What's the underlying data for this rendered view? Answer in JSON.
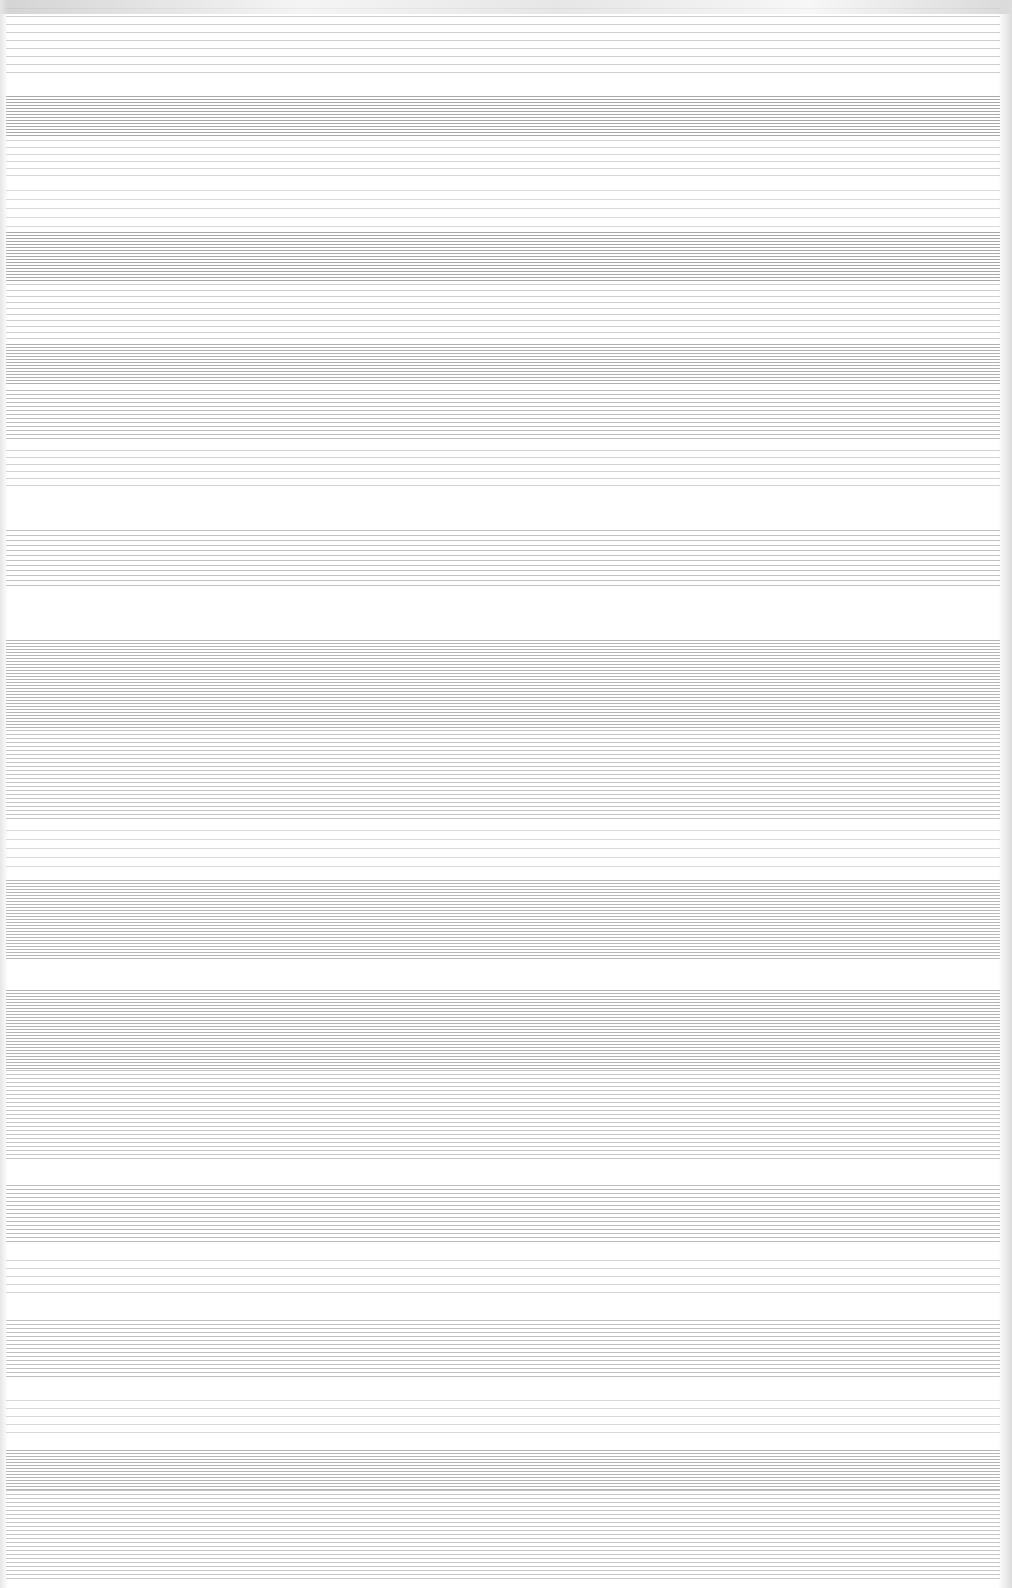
{
  "page": {
    "background": "#ffffff",
    "description_visible_text": []
  },
  "bands": [
    {
      "top": 8,
      "height": 70,
      "color": "#cfcfcf",
      "gap": 8
    },
    {
      "top": 96,
      "height": 40,
      "color": "#a9a9a9",
      "gap": 3
    },
    {
      "top": 140,
      "height": 40,
      "color": "#d6d6d6",
      "gap": 7
    },
    {
      "top": 190,
      "height": 40,
      "color": "#d9d9d9",
      "gap": 9
    },
    {
      "top": 232,
      "height": 50,
      "color": "#a8a8a8",
      "gap": 3
    },
    {
      "top": 284,
      "height": 60,
      "color": "#cfcfcf",
      "gap": 6
    },
    {
      "top": 344,
      "height": 40,
      "color": "#b0b0b0",
      "gap": 3
    },
    {
      "top": 390,
      "height": 50,
      "color": "#bdbdbd",
      "gap": 4
    },
    {
      "top": 450,
      "height": 40,
      "color": "#d2d2d2",
      "gap": 7
    },
    {
      "top": 530,
      "height": 60,
      "color": "#c2c2c2",
      "gap": 5
    },
    {
      "top": 640,
      "height": 90,
      "color": "#b5b5b5",
      "gap": 3
    },
    {
      "top": 730,
      "height": 90,
      "color": "#c4c4c4",
      "gap": 4
    },
    {
      "top": 830,
      "height": 40,
      "color": "#dadada",
      "gap": 9
    },
    {
      "top": 880,
      "height": 80,
      "color": "#b8b8b8",
      "gap": 3
    },
    {
      "top": 990,
      "height": 80,
      "color": "#b2b2b2",
      "gap": 3
    },
    {
      "top": 1070,
      "height": 90,
      "color": "#c6c6c6",
      "gap": 4
    },
    {
      "top": 1185,
      "height": 60,
      "color": "#bcbcbc",
      "gap": 4
    },
    {
      "top": 1260,
      "height": 40,
      "color": "#d6d6d6",
      "gap": 8
    },
    {
      "top": 1320,
      "height": 60,
      "color": "#c0c0c0",
      "gap": 4
    },
    {
      "top": 1400,
      "height": 40,
      "color": "#d8d8d8",
      "gap": 8
    },
    {
      "top": 1450,
      "height": 40,
      "color": "#b4b4b4",
      "gap": 3
    },
    {
      "top": 1490,
      "height": 90,
      "color": "#c6c6c6",
      "gap": 4
    }
  ]
}
